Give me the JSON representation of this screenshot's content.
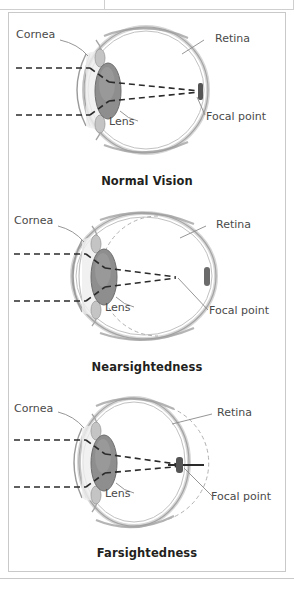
{
  "figure": {
    "alt_title": "Normal Vision, Nearsightedness, and Farsightedness eye diagrams",
    "scan_ghost_text": "· ·  ·   ·",
    "colors": {
      "frame_border": "#c9c9c9",
      "label_text": "#4a4a4a",
      "caption_text": "#231f20",
      "eye_wall_outer": "#9a9a9a",
      "eye_wall_mid": "#bdbdbd",
      "eye_wall_inner": "#d8d8d8",
      "lens_fill": "#8e8e8e",
      "ray_dash": "#2b2b2b",
      "leader_line": "#8a8a8a",
      "reference_arc": "#b0b0b0",
      "focal_point": "#555555"
    },
    "labels": {
      "cornea": "Cornea",
      "lens": "Lens",
      "retina": "Retina",
      "focal_point": "Focal point"
    },
    "panels": [
      {
        "id": "normal",
        "caption": "Normal Vision",
        "eye_shape": "spherical",
        "focal_point_location": "on the retina",
        "reference_arc": false,
        "labels": {
          "cornea": "Cornea",
          "lens": "Lens",
          "retina": "Retina",
          "focal_point": "Focal point"
        }
      },
      {
        "id": "nearsightedness",
        "caption": "Nearsightedness",
        "eye_shape": "elongated front-to-back",
        "focal_point_location": "in front of the retina",
        "reference_arc": true,
        "reference_arc_note": "dashed arc shows normal eye shape inside the elongated eyeball",
        "labels": {
          "cornea": "Cornea",
          "lens": "Lens",
          "retina": "Retina",
          "focal_point": "Focal point"
        }
      },
      {
        "id": "farsightedness",
        "caption": "Farsightedness",
        "eye_shape": "flattened front-to-back",
        "focal_point_location": "behind the retina",
        "reference_arc": true,
        "reference_arc_note": "dashed arc shows normal eye shape outside the flattened eyeball",
        "labels": {
          "cornea": "Cornea",
          "lens": "Lens",
          "retina": "Retina",
          "focal_point": "Focal point"
        }
      }
    ]
  }
}
